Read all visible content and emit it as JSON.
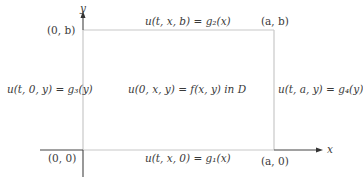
{
  "diagram": {
    "title": "",
    "axes": {
      "x_label": "x",
      "y_label": "y"
    },
    "corners": {
      "origin": "(0, 0)",
      "top_left": "(0, b)",
      "top_right": "(a, b)",
      "bottom_right": "(a, 0)"
    },
    "boundary_conditions": {
      "top": "u(t, x, b) = g₂(x)",
      "bottom": "u(t, x, 0) = g₁(x)",
      "left": "u(t, 0, y) = g₃(y)",
      "right": "u(t, a, y) = g₄(y)"
    },
    "initial_condition": "u(0, x, y) = f(x, y)  in D",
    "colors": {
      "axis": "#444444",
      "boundary": "#c8c8c8",
      "text": "#3a3a3a",
      "background": "#ffffff"
    }
  }
}
